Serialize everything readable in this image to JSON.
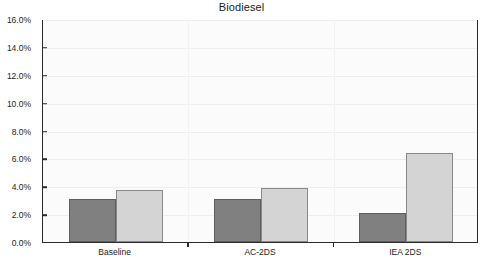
{
  "chart_data": {
    "type": "bar",
    "title": "Biodiesel",
    "xlabel": "",
    "ylabel": "",
    "categories": [
      "Baseline",
      "AC-2DS",
      "IEA 2DS"
    ],
    "series": [
      {
        "name": "2015",
        "values": [
          3.1,
          3.1,
          2.1
        ],
        "color": "#808080"
      },
      {
        "name": "2030",
        "values": [
          3.7,
          3.9,
          6.4
        ],
        "color": "#d4d4d4"
      }
    ],
    "ylim": [
      0.0,
      16.0
    ],
    "ytick_values": [
      0.0,
      2.0,
      4.0,
      6.0,
      8.0,
      10.0,
      12.0,
      14.0,
      16.0
    ],
    "ytick_labels": [
      "0.0%",
      "2.0%",
      "4.0%",
      "6.0%",
      "8.0%",
      "10.0%",
      "12.0%",
      "14.0%",
      "16.0%"
    ],
    "grid": true,
    "legend_position": "top-inside",
    "value_format": "percent"
  },
  "chart": {
    "title": "Biodiesel"
  },
  "legend": {
    "entries": [
      {
        "label": "2015"
      },
      {
        "label": "2030"
      }
    ]
  }
}
